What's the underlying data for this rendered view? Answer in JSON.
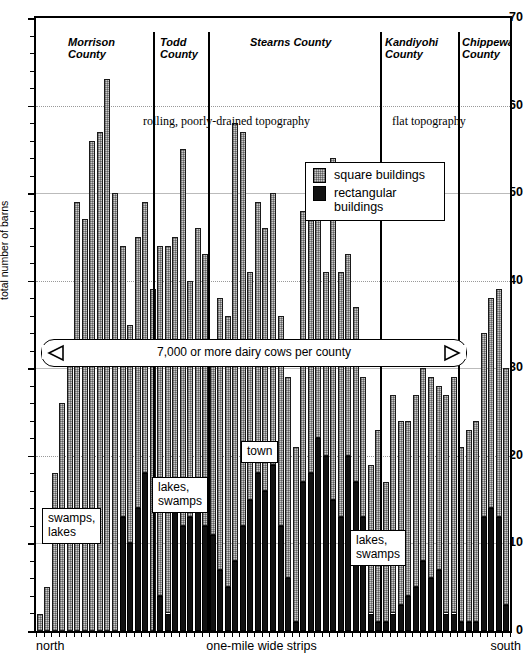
{
  "chart_data": {
    "type": "bar",
    "title": "",
    "xlabel": "one-mile wide strips",
    "ylabel": "total number of barns",
    "ylim": [
      0,
      70
    ],
    "ytick_labels": [
      "0",
      "10",
      "20",
      "30",
      "40",
      "50",
      "60",
      "70"
    ],
    "ytick_values": [
      0,
      10,
      20,
      30,
      40,
      50,
      60,
      70
    ],
    "minor_tick_step": 2,
    "grid": "horizontal dotted/solid at each 10",
    "x_axis_left_label": "north",
    "x_axis_right_label": "south",
    "stacked": true,
    "legend_position": "upper-center-right inside plot",
    "series": [
      {
        "name": "square buildings",
        "color": "#c9c9c9",
        "values": [
          2,
          5,
          18,
          26,
          31,
          49,
          47,
          56,
          57,
          63,
          50,
          31,
          25,
          31,
          31,
          39,
          40,
          42,
          31,
          43,
          27,
          31,
          31,
          22,
          31,
          31,
          50,
          45,
          26,
          31,
          30,
          31,
          24,
          23,
          20,
          31,
          31,
          27,
          21,
          39,
          28,
          23,
          20,
          16,
          17,
          22,
          16,
          25,
          21,
          20,
          22,
          22,
          23,
          21,
          25,
          27,
          20,
          22,
          23,
          21,
          24,
          26,
          27
        ]
      },
      {
        "name": "rectangular buildings",
        "color": "#121212",
        "values": [
          0,
          0,
          0,
          0,
          0,
          0,
          0,
          0,
          0,
          0,
          0,
          13,
          10,
          14,
          18,
          0,
          4,
          2,
          14,
          12,
          13,
          15,
          12,
          11,
          7,
          5,
          8,
          12,
          15,
          18,
          16,
          19,
          12,
          6,
          1,
          17,
          18,
          22,
          20,
          15,
          13,
          20,
          17,
          13,
          2,
          1,
          1,
          2,
          3,
          4,
          5,
          8,
          6,
          7,
          2,
          2,
          1,
          1,
          1,
          13,
          14,
          13,
          3
        ]
      }
    ],
    "bars": [
      {
        "sq": 2,
        "rect": 0
      },
      {
        "sq": 5,
        "rect": 0
      },
      {
        "sq": 18,
        "rect": 0
      },
      {
        "sq": 26,
        "rect": 0
      },
      {
        "sq": 31,
        "rect": 0
      },
      {
        "sq": 49,
        "rect": 0
      },
      {
        "sq": 47,
        "rect": 0
      },
      {
        "sq": 56,
        "rect": 0
      },
      {
        "sq": 57,
        "rect": 0
      },
      {
        "sq": 63,
        "rect": 0
      },
      {
        "sq": 50,
        "rect": 0
      },
      {
        "sq": 31,
        "rect": 13
      },
      {
        "sq": 25,
        "rect": 10
      },
      {
        "sq": 31,
        "rect": 14
      },
      {
        "sq": 31,
        "rect": 18
      },
      {
        "sq": 39,
        "rect": 0
      },
      {
        "sq": 40,
        "rect": 4
      },
      {
        "sq": 42,
        "rect": 2
      },
      {
        "sq": 31,
        "rect": 14
      },
      {
        "sq": 43,
        "rect": 12
      },
      {
        "sq": 27,
        "rect": 13
      },
      {
        "sq": 31,
        "rect": 15
      },
      {
        "sq": 31,
        "rect": 12
      },
      {
        "sq": 22,
        "rect": 11
      },
      {
        "sq": 31,
        "rect": 7
      },
      {
        "sq": 31,
        "rect": 5
      },
      {
        "sq": 50,
        "rect": 8
      },
      {
        "sq": 45,
        "rect": 12
      },
      {
        "sq": 26,
        "rect": 15
      },
      {
        "sq": 31,
        "rect": 18
      },
      {
        "sq": 30,
        "rect": 16
      },
      {
        "sq": 31,
        "rect": 19
      },
      {
        "sq": 24,
        "rect": 12
      },
      {
        "sq": 23,
        "rect": 6
      },
      {
        "sq": 20,
        "rect": 1
      },
      {
        "sq": 31,
        "rect": 17
      },
      {
        "sq": 31,
        "rect": 18
      },
      {
        "sq": 27,
        "rect": 22
      },
      {
        "sq": 21,
        "rect": 20
      },
      {
        "sq": 39,
        "rect": 15
      },
      {
        "sq": 28,
        "rect": 13
      },
      {
        "sq": 23,
        "rect": 20
      },
      {
        "sq": 20,
        "rect": 17
      },
      {
        "sq": 16,
        "rect": 13
      },
      {
        "sq": 17,
        "rect": 2
      },
      {
        "sq": 22,
        "rect": 1
      },
      {
        "sq": 16,
        "rect": 1
      },
      {
        "sq": 25,
        "rect": 2
      },
      {
        "sq": 21,
        "rect": 3
      },
      {
        "sq": 20,
        "rect": 4
      },
      {
        "sq": 22,
        "rect": 5
      },
      {
        "sq": 22,
        "rect": 8
      },
      {
        "sq": 23,
        "rect": 6
      },
      {
        "sq": 21,
        "rect": 7
      },
      {
        "sq": 25,
        "rect": 2
      },
      {
        "sq": 27,
        "rect": 2
      },
      {
        "sq": 20,
        "rect": 1
      },
      {
        "sq": 22,
        "rect": 1
      },
      {
        "sq": 23,
        "rect": 1
      },
      {
        "sq": 21,
        "rect": 13
      },
      {
        "sq": 24,
        "rect": 14
      },
      {
        "sq": 26,
        "rect": 13
      },
      {
        "sq": 27,
        "rect": 3
      }
    ],
    "counties": [
      {
        "name": "Morrison\nCounty",
        "label_x": 68,
        "label_y": 36
      },
      {
        "name": "Todd\nCounty",
        "label_x": 160,
        "label_y": 36
      },
      {
        "name": "Stearns County",
        "label_x": 250,
        "label_y": 36
      },
      {
        "name": "Kandiyohi\nCounty",
        "label_x": 385,
        "label_y": 36
      },
      {
        "name": "Chippewa\nCounty",
        "label_x": 462,
        "label_y": 36
      }
    ],
    "county_divider_x": [
      153,
      208,
      380,
      458
    ],
    "topography_notes": [
      {
        "text": "rolling, poorly-drained topography",
        "x": 143,
        "y": 114
      },
      {
        "text": "flat topography",
        "x": 392,
        "y": 114
      }
    ],
    "annotations": [
      {
        "text": "swamps,\nlakes",
        "x": 42,
        "y": 508
      },
      {
        "text": "lakes,\nswamps",
        "x": 152,
        "y": 477
      },
      {
        "text": "town",
        "x": 241,
        "y": 441
      },
      {
        "text": "lakes,\nswamps",
        "x": 350,
        "y": 530
      }
    ],
    "banner": {
      "text": "7,000 or more dairy cows per county"
    }
  },
  "legend": {
    "items": [
      {
        "label": "square buildings",
        "swatch": "square-hatched-swatch"
      },
      {
        "label": "rectangular\nbuildings",
        "swatch": "solid-black-swatch"
      }
    ]
  }
}
